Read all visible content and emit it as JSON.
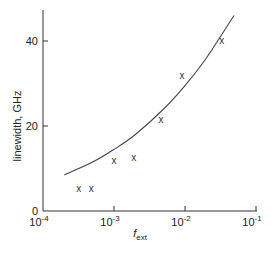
{
  "chart_data": {
    "type": "scatter",
    "title": "",
    "xlabel": "f_ext",
    "xlabel_main": "f",
    "xlabel_sub": "ext",
    "ylabel": "linewidth, GHz",
    "xscale": "log",
    "xlim": [
      0.0001,
      0.1
    ],
    "ylim": [
      0,
      47
    ],
    "grid": false,
    "legend": null,
    "x_ticks": [
      {
        "value": 0.0001,
        "base": "10",
        "exp": "-4"
      },
      {
        "value": 0.001,
        "base": "10",
        "exp": "-3"
      },
      {
        "value": 0.01,
        "base": "10",
        "exp": "-2"
      },
      {
        "value": 0.1,
        "base": "10",
        "exp": "-1"
      }
    ],
    "y_ticks": [
      {
        "value": 0,
        "label": "0"
      },
      {
        "value": 20,
        "label": "20"
      },
      {
        "value": 40,
        "label": "40"
      }
    ],
    "series": [
      {
        "name": "measured",
        "type": "scatter",
        "marker": "x",
        "x": [
          0.00032,
          0.00048,
          0.001,
          0.0019,
          0.0046,
          0.0091,
          0.033
        ],
        "y": [
          5.2,
          5.4,
          12.0,
          12.7,
          21.6,
          32.0,
          40.2
        ]
      },
      {
        "name": "theory",
        "type": "line",
        "x": [
          0.0002,
          0.0005,
          0.001,
          0.002,
          0.005,
          0.01,
          0.02,
          0.049
        ],
        "y": [
          8.5,
          11.5,
          14.5,
          18.0,
          24.0,
          29.5,
          36.0,
          46.0
        ]
      }
    ]
  },
  "marker_glyph": "x"
}
